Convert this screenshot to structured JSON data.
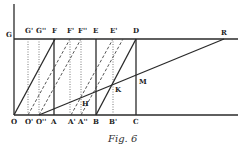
{
  "figure": {
    "caption": "Fig. 6",
    "top_labels": [
      {
        "id": "G",
        "text": "G",
        "x": 6
      },
      {
        "id": "G1",
        "text": "G'",
        "x": 26
      },
      {
        "id": "G2",
        "text": "G''",
        "x": 37
      },
      {
        "id": "F",
        "text": "F",
        "x": 52
      },
      {
        "id": "F1",
        "text": "F'",
        "x": 67
      },
      {
        "id": "F2",
        "text": "F''",
        "x": 78
      },
      {
        "id": "E",
        "text": "E",
        "x": 93
      },
      {
        "id": "E1",
        "text": "E'",
        "x": 110
      },
      {
        "id": "D",
        "text": "D",
        "x": 133
      },
      {
        "id": "R",
        "text": "R",
        "x": 221
      }
    ],
    "bottom_labels": [
      {
        "id": "O",
        "text": "O",
        "x": 11
      },
      {
        "id": "O1",
        "text": "O'",
        "x": 25
      },
      {
        "id": "O2",
        "text": "O''",
        "x": 36
      },
      {
        "id": "A",
        "text": "A",
        "x": 51
      },
      {
        "id": "A1",
        "text": "A'",
        "x": 68
      },
      {
        "id": "A2",
        "text": "A''",
        "x": 78
      },
      {
        "id": "B",
        "text": "B",
        "x": 93
      },
      {
        "id": "B1",
        "text": "B'",
        "x": 109
      },
      {
        "id": "C",
        "text": "C",
        "x": 133
      }
    ],
    "point_labels": [
      {
        "id": "H",
        "text": "H",
        "x": 80,
        "y": 103
      },
      {
        "id": "K",
        "text": "K",
        "x": 115,
        "y": 91
      },
      {
        "id": "M",
        "text": "M",
        "x": 139,
        "y": 82
      }
    ]
  }
}
